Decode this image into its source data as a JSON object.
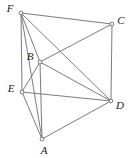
{
  "figure": {
    "background_color": "#ffffff",
    "edge_color": "#7c7c7c",
    "vertex_fill_color": "#ffffff",
    "vertex_stroke_color": "#6e6e6e",
    "label_color": "#1c1c1c",
    "width": 130,
    "height": 158,
    "vertices": [
      {
        "id": "A",
        "label": "A",
        "x": 42,
        "y": 139,
        "label_x": 44,
        "label_y": 151
      },
      {
        "id": "B",
        "label": "B",
        "x": 40,
        "y": 62,
        "label_x": 30,
        "label_y": 57
      },
      {
        "id": "C",
        "label": "C",
        "x": 112,
        "y": 24,
        "label_x": 121,
        "label_y": 21
      },
      {
        "id": "D",
        "label": "D",
        "x": 111,
        "y": 101,
        "label_x": 120,
        "label_y": 106
      },
      {
        "id": "E",
        "label": "E",
        "x": 22,
        "y": 92,
        "label_x": 11,
        "label_y": 89
      },
      {
        "id": "F",
        "label": "F",
        "x": 21,
        "y": 13,
        "label_x": 10,
        "label_y": 9
      }
    ],
    "edges": [
      {
        "from": "F",
        "to": "C",
        "name": "edge-f-c"
      },
      {
        "from": "F",
        "to": "E",
        "name": "edge-f-e"
      },
      {
        "from": "F",
        "to": "B",
        "name": "edge-f-b"
      },
      {
        "from": "F",
        "to": "D",
        "name": "edge-f-d"
      },
      {
        "from": "F",
        "to": "A",
        "name": "edge-f-a"
      },
      {
        "from": "C",
        "to": "D",
        "name": "edge-c-d"
      },
      {
        "from": "C",
        "to": "B",
        "name": "edge-c-b"
      },
      {
        "from": "B",
        "to": "E",
        "name": "edge-b-e"
      },
      {
        "from": "B",
        "to": "D",
        "name": "edge-b-d"
      },
      {
        "from": "B",
        "to": "A",
        "name": "edge-b-a"
      },
      {
        "from": "E",
        "to": "D",
        "name": "edge-e-d"
      },
      {
        "from": "E",
        "to": "A",
        "name": "edge-e-a"
      },
      {
        "from": "A",
        "to": "D",
        "name": "edge-a-d"
      }
    ]
  }
}
